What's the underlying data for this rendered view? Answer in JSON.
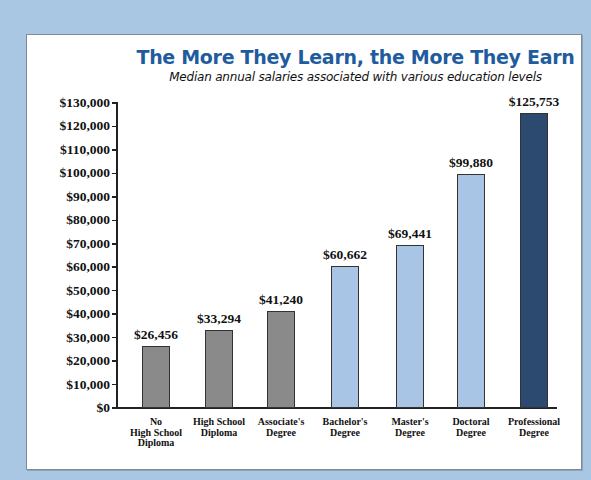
{
  "chart_data": {
    "type": "bar",
    "title": "The More They Learn, the More They Earn",
    "subtitle": "Median annual salaries associated with various education levels",
    "xlabel": "",
    "ylabel": "",
    "ylim": [
      0,
      130000
    ],
    "grid": false,
    "legend": null,
    "yticks": [
      "$0",
      "$10,000",
      "$20,000",
      "$30,000",
      "$40,000",
      "$50,000",
      "$60,000",
      "$70,000",
      "$80,000",
      "$90,000",
      "$100,000",
      "$110,000",
      "$120,000",
      "$130,000"
    ],
    "categories": [
      "No\nHigh School\nDiploma",
      "High School\nDiploma",
      "Associate's\nDegree",
      "Bachelor's\nDegree",
      "Master's\nDegree",
      "Doctoral\nDegree",
      "Professional\nDegree"
    ],
    "values": [
      26456,
      33294,
      41240,
      60662,
      69441,
      99880,
      125753
    ],
    "value_labels": [
      "$26,456",
      "$33,294",
      "$41,240",
      "$60,662",
      "$69,441",
      "$99,880",
      "$125,753"
    ],
    "bar_colors": [
      "#8a8a8a",
      "#8a8a8a",
      "#8a8a8a",
      "#a9c5e6",
      "#a9c5e6",
      "#a9c5e6",
      "#2c4a6f"
    ]
  },
  "colors": {
    "background": "#a9c6e3",
    "title": "#1f5c9e",
    "panel": "#ffffff"
  }
}
